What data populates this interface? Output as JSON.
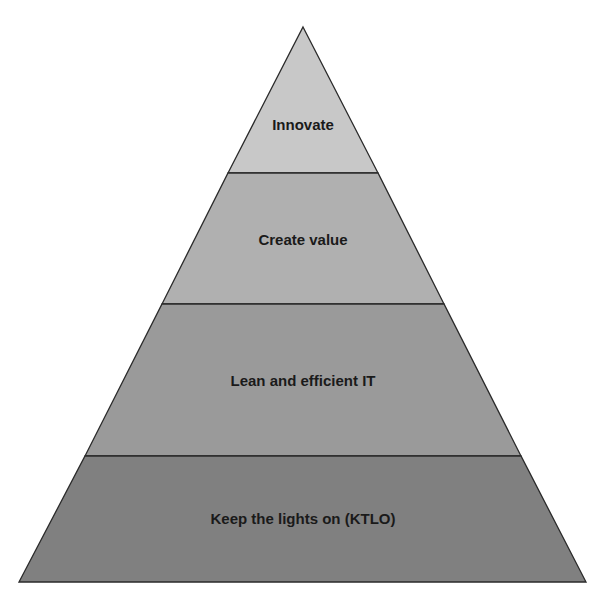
{
  "diagram": {
    "type": "pyramid",
    "levels": [
      {
        "label": "Innovate",
        "color": "#c8c8c8"
      },
      {
        "label": "Create value",
        "color": "#b0b0b0"
      },
      {
        "label": "Lean and efficient IT",
        "color": "#9a9a9a"
      },
      {
        "label": "Keep the lights on (KTLO)",
        "color": "#808080"
      }
    ],
    "outline_color": "#2a2a2a"
  }
}
